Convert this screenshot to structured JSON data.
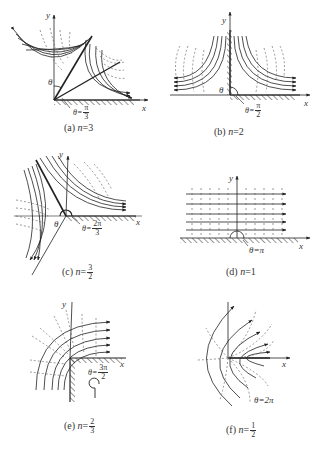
{
  "figure": {
    "panels": [
      {
        "id": "a",
        "caption_prefix": "(a) ",
        "caption_var": "n",
        "caption_eq": "=3",
        "n": "3",
        "angle_label_prefix": "θ=",
        "angle_num": "π",
        "angle_den": "3",
        "corner_angle_symbol": "θ",
        "x_axis": "x",
        "y_axis": "y"
      },
      {
        "id": "b",
        "caption_prefix": "(b) ",
        "caption_var": "n",
        "caption_eq": "=2",
        "n": "2",
        "angle_label_prefix": "θ=",
        "angle_num": "π",
        "angle_den": "2",
        "corner_angle_symbol": "θ",
        "x_axis": "x",
        "y_axis": "y"
      },
      {
        "id": "c",
        "caption_prefix": "(c) ",
        "caption_var": "n",
        "caption_eq": "=",
        "caption_num": "3",
        "caption_den": "2",
        "n": "3/2",
        "angle_label_prefix": "θ=",
        "angle_num": "2π",
        "angle_den": "3",
        "corner_angle_symbol": "θ",
        "x_axis": "x",
        "y_axis": "y"
      },
      {
        "id": "d",
        "caption_prefix": "(d) ",
        "caption_var": "n",
        "caption_eq": "=1",
        "n": "1",
        "angle_label": "θ=π",
        "x_axis": "x",
        "y_axis": "y"
      },
      {
        "id": "e",
        "caption_prefix": "(e) ",
        "caption_var": "n",
        "caption_eq": "=",
        "caption_num": "2",
        "caption_den": "3",
        "n": "2/3",
        "angle_label_prefix": "θ=",
        "angle_num": "3π",
        "angle_den": "2",
        "x_axis": "x",
        "y_axis": "y"
      },
      {
        "id": "f",
        "caption_prefix": "(f) ",
        "caption_var": "n",
        "caption_eq": "=",
        "caption_num": "1",
        "caption_den": "2",
        "n": "1/2",
        "angle_label": "θ=2π",
        "x_axis": "x",
        "y_axis": "y"
      }
    ],
    "legend": {
      "solid_lines": "streamlines",
      "dashed_lines": "equipotential lines"
    },
    "colors": {
      "ink": "#222222",
      "dashed": "#555555",
      "background": "#ffffff"
    }
  }
}
